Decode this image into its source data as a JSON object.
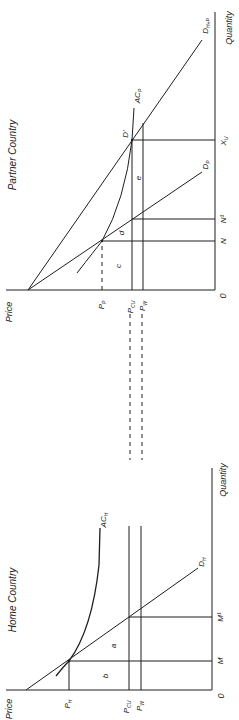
{
  "figure": {
    "orientation": "rotated 90 degrees counter-clockwise (text reads bottom-to-top)",
    "colors": {
      "ink": "#1e1e1e",
      "background": "#ffffff"
    }
  },
  "partner": {
    "title": "Partner Country",
    "y_axis_label": "Price",
    "x_axis_label": "Quantity",
    "origin": "0",
    "price_labels": {
      "pp": "P",
      "pp_sub": "P",
      "pcu": "P",
      "pcu_sub": "CU",
      "pw": "P",
      "pw_sub": "W"
    },
    "quantity_labels": {
      "n": "N",
      "n1": "N¹",
      "xu": "X",
      "xu_sub": "U"
    },
    "curves": {
      "dp": "D",
      "dp_sub": "P",
      "dhp": "D",
      "dhp_sub": "H+P",
      "acp": "AC",
      "acp_sub": "P"
    },
    "point_label": "D'",
    "areas": {
      "c": "c",
      "d": "d",
      "e": "e"
    }
  },
  "home": {
    "title": "Home Country",
    "y_axis_label": "Price",
    "x_axis_label": "Quantity",
    "origin": "0",
    "price_labels": {
      "ph": "P",
      "ph_sub": "H",
      "pcu": "P",
      "pcu_sub": "CU",
      "pw": "P",
      "pw_sub": "W"
    },
    "quantity_labels": {
      "m": "M",
      "m1": "M¹"
    },
    "curves": {
      "dh": "D",
      "dh_sub": "H",
      "ach": "AC",
      "ach_sub": "H"
    },
    "areas": {
      "a": "a",
      "b": "b"
    }
  }
}
